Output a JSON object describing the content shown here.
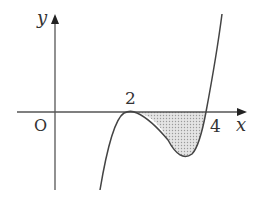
{
  "diagram": {
    "type": "function-graph",
    "axes": {
      "x_label": "x",
      "y_label": "y",
      "origin_label": "O"
    },
    "tick_labels": {
      "tangent_point": "2",
      "root": "4"
    },
    "curve": {
      "description": "cubic tangent to x-axis at x=2 and crossing at x=4",
      "color": "#444444"
    },
    "shaded_region": {
      "description": "area between curve and x-axis from x=2 to x=4",
      "fill": "#c8c8c8"
    }
  }
}
